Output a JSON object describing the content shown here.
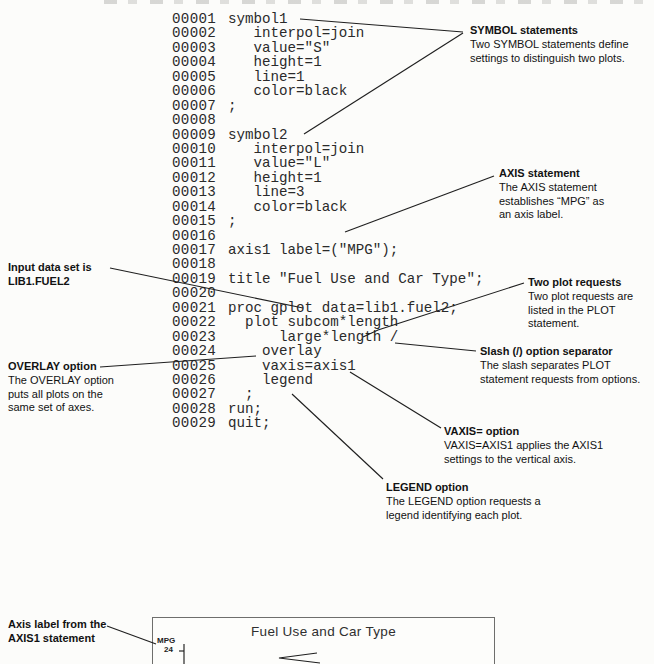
{
  "code": {
    "lines": [
      {
        "num": "00001",
        "text": "symbol1"
      },
      {
        "num": "00002",
        "text": "   interpol=join"
      },
      {
        "num": "00003",
        "text": "   value=\"S\""
      },
      {
        "num": "00004",
        "text": "   height=1"
      },
      {
        "num": "00005",
        "text": "   line=1"
      },
      {
        "num": "00006",
        "text": "   color=black"
      },
      {
        "num": "00007",
        "text": ";"
      },
      {
        "num": "00008",
        "text": ""
      },
      {
        "num": "00009",
        "text": "symbol2"
      },
      {
        "num": "00010",
        "text": "   interpol=join"
      },
      {
        "num": "00011",
        "text": "   value=\"L\""
      },
      {
        "num": "00012",
        "text": "   height=1"
      },
      {
        "num": "00013",
        "text": "   line=3"
      },
      {
        "num": "00014",
        "text": "   color=black"
      },
      {
        "num": "00015",
        "text": ";"
      },
      {
        "num": "00016",
        "text": ""
      },
      {
        "num": "00017",
        "text": "axis1 label=(\"MPG\");"
      },
      {
        "num": "00018",
        "text": ""
      },
      {
        "num": "00019",
        "text": "title \"Fuel Use and Car Type\";"
      },
      {
        "num": "00020",
        "text": ""
      },
      {
        "num": "00021",
        "text": "proc gplot data=lib1.fuel2;"
      },
      {
        "num": "00022",
        "text": "  plot subcom*length"
      },
      {
        "num": "00023",
        "text": "      large*length /"
      },
      {
        "num": "00024",
        "text": "    overlay"
      },
      {
        "num": "00025",
        "text": "    vaxis=axis1"
      },
      {
        "num": "00026",
        "text": "    legend"
      },
      {
        "num": "00027",
        "text": "  ;"
      },
      {
        "num": "00028",
        "text": "run;"
      },
      {
        "num": "00029",
        "text": "quit;"
      }
    ]
  },
  "annotations": {
    "right": [
      {
        "title": "SYMBOL statements",
        "body": "Two SYMBOL statements define\nsettings to distinguish two plots."
      },
      {
        "title": "AXIS statement",
        "body": "The AXIS statement\nestablishes “MPG” as\nan axis label."
      },
      {
        "title": "Two plot requests",
        "body": "Two plot requests are\nlisted in the PLOT\nstatement."
      },
      {
        "title": "Slash (/) option separator",
        "body": "The slash separates PLOT\nstatement requests from options."
      },
      {
        "title": "VAXIS= option",
        "body": "VAXIS=AXIS1 applies the AXIS1\nsettings to the vertical axis."
      },
      {
        "title": "LEGEND option",
        "body": "The LEGEND option requests a\nlegend identifying each plot."
      }
    ],
    "left": [
      {
        "title": "Input data set is\nLIB1.FUEL2",
        "body": ""
      },
      {
        "title": "OVERLAY option",
        "body": "The OVERLAY option\nputs all plots on the\nsame set of axes."
      },
      {
        "title": "Axis label from the\nAXIS1 statement",
        "body": ""
      }
    ]
  },
  "chart": {
    "title": "Fuel Use and Car Type",
    "y_axis_label": "MPG",
    "first_tick_value": "24"
  }
}
